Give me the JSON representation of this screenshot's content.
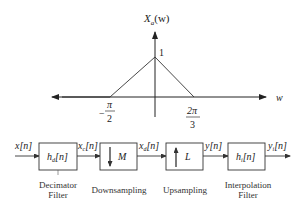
{
  "spectrum_plot": {
    "y_label": "X_a(w)",
    "y_label_main": "X",
    "y_label_sub": "a",
    "y_label_arg": "(w)",
    "peak_value": "1",
    "x_axis_label": "w",
    "left_break": {
      "sign": "−",
      "numerator": "π",
      "denominator": "2"
    },
    "right_break": {
      "numerator": "2π",
      "denominator": "3"
    }
  },
  "block_diagram": {
    "signals": {
      "input": {
        "main": "x",
        "sub": "",
        "arg": "[n]"
      },
      "after_filter": {
        "main": "x",
        "sub": "c",
        "arg": "[n]"
      },
      "after_down": {
        "main": "x",
        "sub": "d",
        "arg": "[n]"
      },
      "after_up": {
        "main": "y",
        "sub": "",
        "arg": "[n]"
      },
      "output": {
        "main": "y",
        "sub": "i",
        "arg": "[n]"
      }
    },
    "blocks": [
      {
        "label_main": "h",
        "label_sub": "d",
        "label_arg": "[n]",
        "caption_line1": "Decimator",
        "caption_line2": "Filter"
      },
      {
        "symbol": "M",
        "arrow": "down",
        "caption_line1": "Downsampling",
        "caption_line2": ""
      },
      {
        "symbol": "L",
        "arrow": "up",
        "caption_line1": "Upsampling",
        "caption_line2": ""
      },
      {
        "label_main": "h",
        "label_sub": "i",
        "label_arg": "[n]",
        "caption_line1": "Interpolation",
        "caption_line2": "Filter"
      }
    ]
  }
}
